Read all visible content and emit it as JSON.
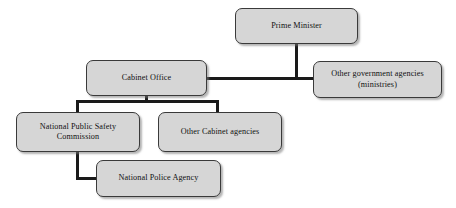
{
  "diagram": {
    "background_color": "#ffffff",
    "node_fill_color": "#d6d6d6",
    "node_border_color": "#3a3a3a",
    "connector_color": "#1a1a1a",
    "nodes": [
      {
        "id": "prime-minister",
        "label": "Prime Minister",
        "level": 1
      },
      {
        "id": "cabinet-office",
        "label": "Cabinet Office",
        "level": 2
      },
      {
        "id": "other-government-agencies",
        "label": "Other government agencies\n(ministries)",
        "level": 2
      },
      {
        "id": "national-public-safety-commission",
        "label": "National Public Safety\nCommission",
        "level": 3
      },
      {
        "id": "other-cabinet-agencies",
        "label": "Other Cabinet agencies",
        "level": 3
      },
      {
        "id": "national-police-agency",
        "label": "National Police Agency",
        "level": 4
      }
    ],
    "edges": [
      {
        "from": "prime-minister",
        "to": "cabinet-office"
      },
      {
        "from": "prime-minister",
        "to": "other-government-agencies"
      },
      {
        "from": "cabinet-office",
        "to": "national-public-safety-commission"
      },
      {
        "from": "cabinet-office",
        "to": "other-cabinet-agencies"
      },
      {
        "from": "national-public-safety-commission",
        "to": "national-police-agency"
      }
    ]
  }
}
